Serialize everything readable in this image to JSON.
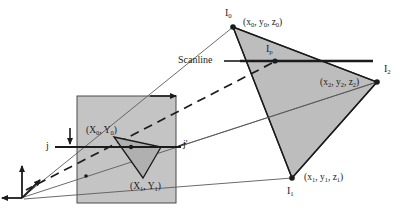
{
  "figure": {
    "background": "#ffffff",
    "width": 406,
    "height": 213
  },
  "colors": {
    "triangle_fill": "#bdbdbd",
    "screen_fill": "#c4c4c4",
    "projected_fill": "#b0b0b0",
    "stroke_dark": "#1b1b1b",
    "stroke_thin": "#5a5a5a",
    "text": "#1b1b1b"
  },
  "world_triangle": {
    "name": "world-space-triangle",
    "vertices": [
      {
        "id": "I0",
        "label": "I",
        "subscript": "0",
        "coord": "(x0, y0, z0)",
        "x": 233,
        "y": 27
      },
      {
        "id": "I1",
        "label": "I",
        "subscript": "1",
        "coord": "(x1, y1, z1)",
        "x": 292,
        "y": 178
      },
      {
        "id": "I2",
        "label": "I",
        "subscript": "2",
        "coord": "(x2, y2, z2)",
        "x": 377,
        "y": 82
      }
    ]
  },
  "labels": {
    "i0_vertex": "I",
    "i0_sub": "0",
    "i0_coord_open": "(x",
    "i0_coord": "(x0, y0, z0)",
    "i1_vertex": "I",
    "i1_sub": "1",
    "i1_coord": "(x1, y1, z1)",
    "i2_vertex": "I",
    "i2_sub": "2",
    "i2_coord": "(x2, y2, z2)",
    "ip_vertex": "I",
    "ip_sub": "p",
    "scanline": "Scanline",
    "screen_x0": "(X",
    "screen_x0_sub": "0",
    "screen_y0": ", Y",
    "screen_y0_sub": "0",
    "screen_close": ")",
    "screen_v0_full": "(X0, Y0)",
    "screen_v1_full": "(X1, Y1)",
    "j_label": "j",
    "j_prime_label": "j'"
  },
  "screen_rect": {
    "name": "screen-viewport",
    "x": 77,
    "y": 96,
    "width": 99,
    "height": 107
  },
  "projected_triangle": {
    "name": "projected-triangle",
    "vertices": [
      {
        "id": "X0Y0",
        "coord": "(X0, Y0)",
        "x": 114,
        "y": 137
      },
      {
        "id": "X1Y1",
        "coord": "(X1, Y1)",
        "x": 143,
        "y": 178
      },
      {
        "id": "XR",
        "coord": "",
        "x": 161,
        "y": 147
      }
    ]
  },
  "scanlines": {
    "world": {
      "name": "world-scanline",
      "x1": 240,
      "y1": 61,
      "x2": 373,
      "y2": 61
    },
    "screen": {
      "name": "screen-scanline-j",
      "x1": 55,
      "y1": 147,
      "x2": 181,
      "y2": 147
    }
  },
  "ip_point": {
    "name": "interpolated-point-ip",
    "x": 275,
    "y": 61
  },
  "axes": {
    "name": "coordinate-axes",
    "origin_x": 22,
    "origin_y": 198
  },
  "icons": {
    "arrow_right": "arrow-right-icon",
    "arrow_up": "arrow-up-icon",
    "arrow_left": "arrow-left-icon",
    "arrow_down": "arrow-down-icon",
    "dashed_ray": "dashed-projection-ray"
  }
}
